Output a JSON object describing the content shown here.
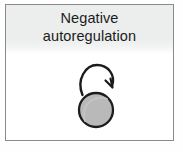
{
  "panel": {
    "title": {
      "line1": "Negative",
      "line2": "autoregulation"
    },
    "header_background_color": "#eceded",
    "border_color": "#8a8a8a",
    "body_background_color": "#ffffff"
  },
  "diagram": {
    "type": "network-motif",
    "name": "negative-autoregulation",
    "nodes": [
      {
        "id": "gene-node",
        "label": "",
        "shape": "circle",
        "center_x": 90,
        "center_y": 105,
        "radius": 17,
        "fill_color": "#b8b8b8",
        "stroke_color": "#1c1c1c",
        "stroke_width": 2.2
      }
    ],
    "edges": [
      {
        "id": "self-loop",
        "from": "gene-node",
        "to": "gene-node",
        "kind": "self-loop",
        "sign": "negative",
        "arrowhead": "open-arrow",
        "stroke_color": "#1c1c1c",
        "stroke_width": 2.4
      }
    ]
  }
}
